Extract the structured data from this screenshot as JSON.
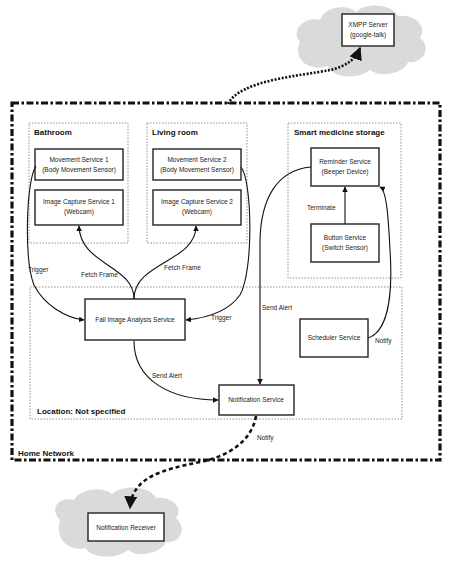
{
  "diagram": {
    "type": "system-architecture",
    "external": {
      "xmpp_server": {
        "line1": "XMPP Server",
        "line2": "(google-talk)"
      },
      "notification_receiver": {
        "label": "Notification Receiver"
      }
    },
    "home_network": {
      "label": "Home Network",
      "groups": {
        "bathroom": {
          "label": "Bathroom",
          "nodes": {
            "movement": {
              "line1": "Movement Service 1",
              "line2": "(Body Movement Sensor)"
            },
            "image_capture": {
              "line1": "Image Capture Service 1",
              "line2": "(Webcam)"
            }
          }
        },
        "living_room": {
          "label": "Living room",
          "nodes": {
            "movement": {
              "line1": "Movement Service 2",
              "line2": "(Body Movement Sensor)"
            },
            "image_capture": {
              "line1": "Image Capture Service 2",
              "line2": "(Webcam)"
            }
          }
        },
        "smart_medicine_storage": {
          "label": "Smart medicine storage",
          "nodes": {
            "reminder": {
              "line1": "Reminder Service",
              "line2": "(Beeper Device)"
            },
            "button": {
              "line1": "Button Service",
              "line2": "(Switch Sensor)"
            }
          }
        },
        "location_not_specified": {
          "label": "Location: Not specified",
          "nodes": {
            "fall_image_analysis": {
              "label": "Fall Image Analysis Service"
            },
            "scheduler": {
              "label": "Scheduler Service"
            },
            "notification": {
              "label": "Notification Service"
            }
          }
        }
      }
    },
    "edges": {
      "trigger_left": "Trigger",
      "trigger_right": "Trigger",
      "fetch_frame_left": "Fetch Frame",
      "fetch_frame_right": "Fetch Frame",
      "terminate": "Terminate",
      "send_alert_reminder": "Send Alert",
      "send_alert_notification": "Send Alert",
      "notify_scheduler": "Notify",
      "notify_receiver": "Notify"
    },
    "colors": {
      "cloud_fill": "#dadada",
      "stroke": "#111111",
      "group_border": "#777777"
    }
  }
}
